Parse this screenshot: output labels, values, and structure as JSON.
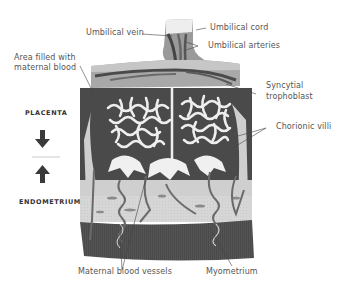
{
  "diagram": {
    "side_labels": {
      "top": "PLACENTA",
      "bottom": "ENDOMETRIUM"
    },
    "labels": [
      {
        "id": "umbilical-vein",
        "text": "Umbilical vein"
      },
      {
        "id": "umbilical-cord",
        "text": "Umbilical cord"
      },
      {
        "id": "umbilical-arteries",
        "text": "Umbilical arteries"
      },
      {
        "id": "area-maternal-blood",
        "lines": [
          "Area filled with",
          "maternal blood"
        ]
      },
      {
        "id": "syncytial-trophoblast",
        "lines": [
          "Syncytial",
          "trophoblast"
        ]
      },
      {
        "id": "chorionic-villi",
        "text": "Chorionic villi"
      },
      {
        "id": "maternal-blood-vessels",
        "text": "Maternal blood vessels"
      },
      {
        "id": "myometrium",
        "text": "Myometrium"
      }
    ],
    "colors": {
      "background": "#ffffff",
      "label_text": "#555555",
      "caption_text": "#333333",
      "blood_space": "#4a4a4a",
      "tissue_light": "#d4d4d4",
      "myometrium": "#555555",
      "villi": "#eeeeee",
      "arrow": "#3a3a3a",
      "leader_line": "#444444"
    }
  }
}
